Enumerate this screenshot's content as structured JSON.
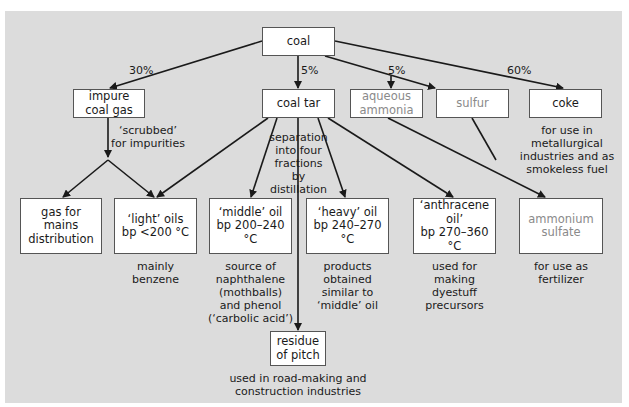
{
  "diagram": {
    "root": "coal",
    "percentages": {
      "impure_coal_gas": "30%",
      "coal_tar": "5%",
      "aqueous_ammonia": "5%",
      "coke": "60%"
    },
    "boxes": {
      "coal": "coal",
      "impure_coal_gas": "impure\ncoal gas",
      "coal_tar": "coal tar",
      "aqueous_ammonia": "aqueous\nammonia",
      "sulfur": "sulfur",
      "coke": "coke",
      "gas_for_mains": "gas for\nmains\ndistribution",
      "light_oils": "‘light’ oils\nbp <200 °C",
      "middle_oil": "‘middle’ oil\nbp 200–240 °C",
      "heavy_oil": "‘heavy’ oil\nbp 240–270 °C",
      "anthracene_oil": "‘anthracene oil’\nbp 270–360 °C",
      "ammonium_sulfate": "ammonium\nsulfate",
      "residue_of_pitch": "residue\nof pitch"
    },
    "annotations": {
      "scrubbed": "‘scrubbed’\nfor impurities",
      "separation": "separation\ninto four\nfractions\nby distillation",
      "coke_use": "for use in\nmetallurgical\nindustries and as\nsmokeless fuel",
      "light_use": "mainly\nbenzene",
      "middle_use": "source of\nnaphthalene\n(mothballs)\nand phenol\n(‘carbolic acid’)",
      "heavy_use": "products\nobtained\nsimilar to\n‘middle’ oil",
      "anthracene_use": "used for\nmaking\ndyestuff\nprecursors",
      "ammonium_use": "for use as\nfertilizer",
      "pitch_use": "used in road-making and\nconstruction industries"
    },
    "colors": {
      "panel": "#dcdcdc",
      "box": "#ffffff",
      "line": "#1a1a1a",
      "grey_text": "#8a8a8a"
    }
  }
}
